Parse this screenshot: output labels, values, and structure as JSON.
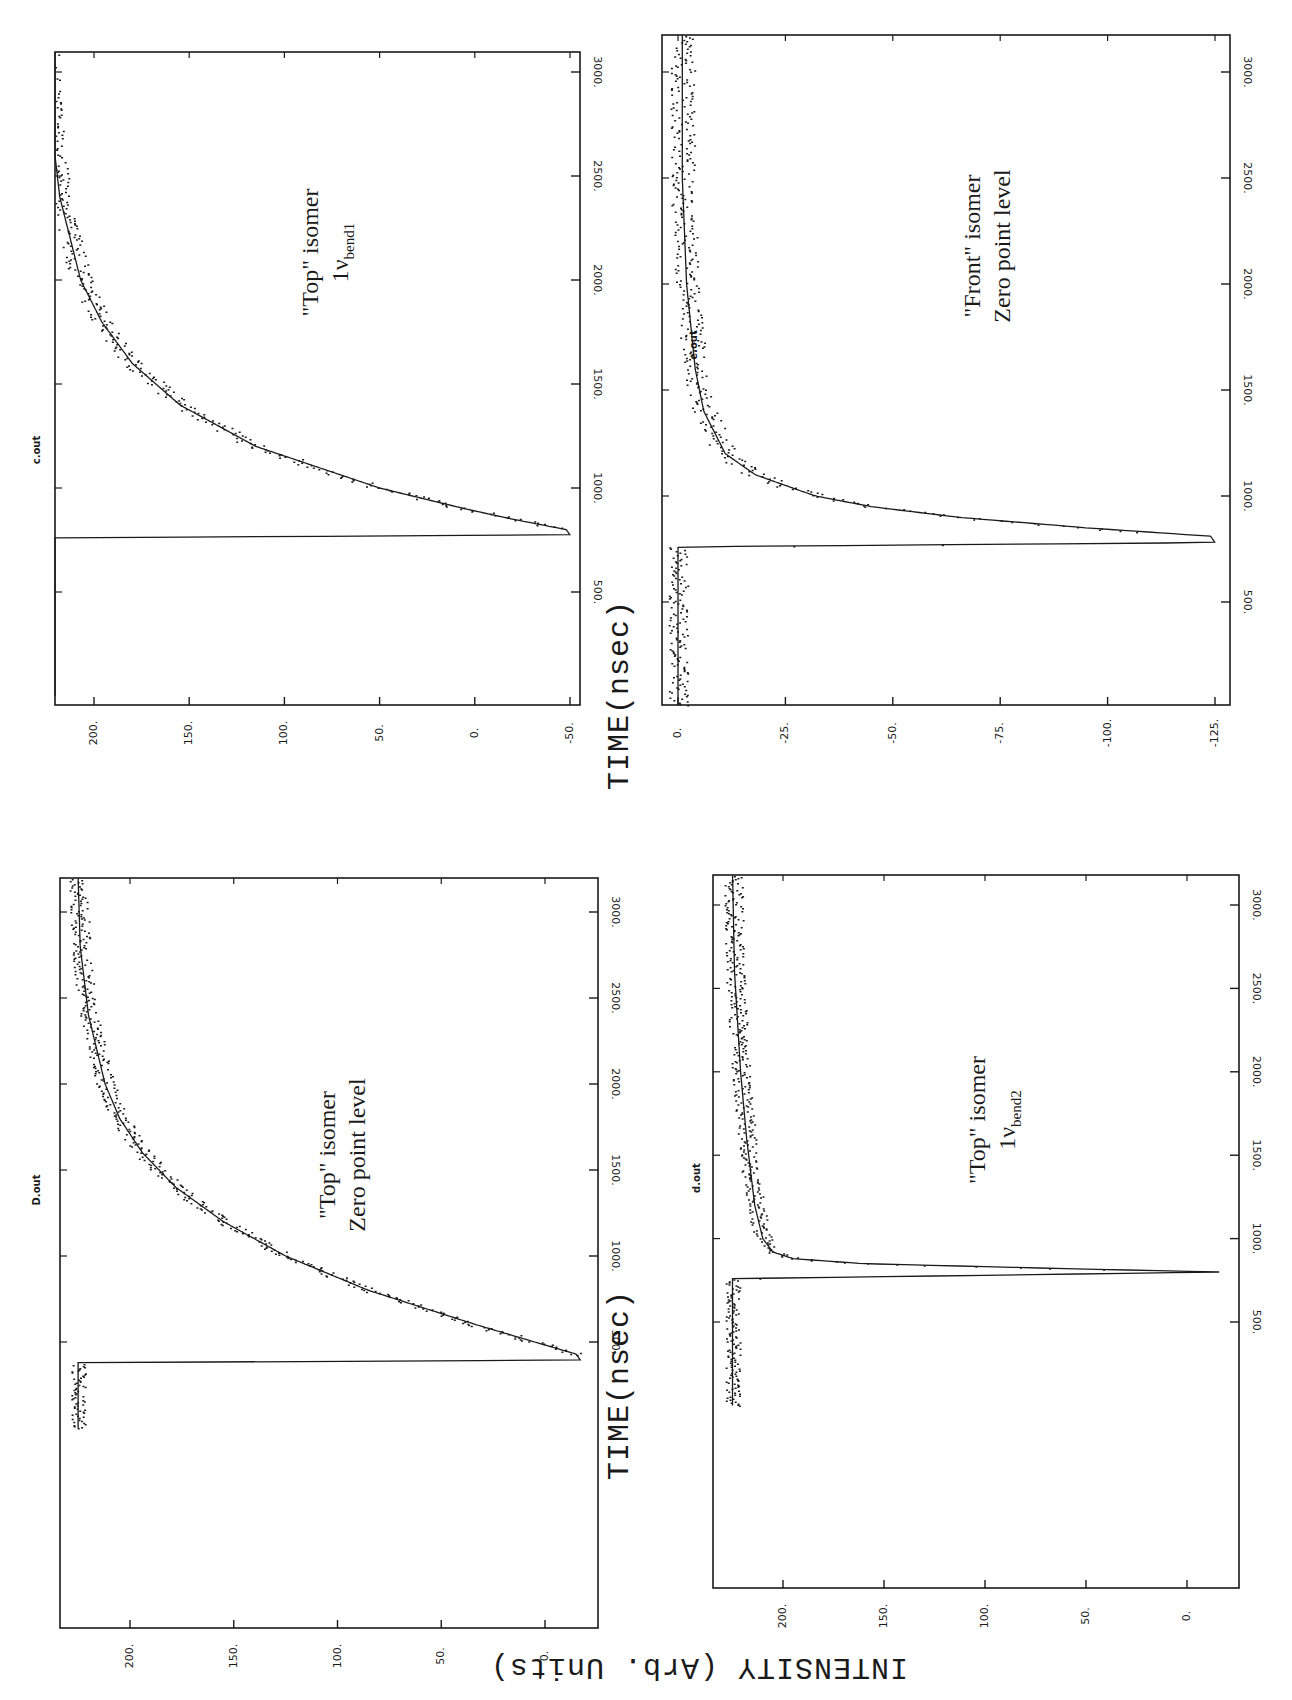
{
  "figure": {
    "orientation": "rotated 90 degrees counter-clockwise",
    "shared_xlabel": "TIME(nsec)",
    "shared_ylabel": "INTENSITY (Arb. Units)"
  },
  "chart_data": [
    {
      "type": "line",
      "panel": "top-left",
      "file_label": "c.out",
      "annotation": [
        "\"Top\" isomer",
        "1ν",
        "bend1"
      ],
      "annotation_text": "\"Top\" isomer 1ν_bend1",
      "xlabel": "TIME(nsec)",
      "ylabel": "INTENSITY (Arb. Units)",
      "x_ticks": [
        500,
        1000,
        1500,
        2000,
        2500,
        3000
      ],
      "x_tick_labels": [
        "500.",
        "1000.",
        "1500.",
        "2000.",
        "2500.",
        "3000."
      ],
      "y_ticks": [
        200,
        150,
        100,
        50,
        0,
        -50
      ],
      "y_tick_labels": [
        "200.",
        "150.",
        "100.",
        "50.",
        "0.",
        "-50."
      ],
      "xlim": [
        0,
        3200
      ],
      "ylim": [
        -55,
        235
      ],
      "grid": false,
      "series": [
        {
          "name": "data (noisy)",
          "style": "points",
          "x": [
            0,
            100,
            200,
            300,
            400,
            500,
            600,
            700,
            760,
            780,
            800,
            820,
            850,
            900,
            950,
            1000,
            1100,
            1200,
            1300,
            1400,
            1500,
            1600,
            1800,
            2000,
            2200,
            2400,
            2600,
            2800,
            3000,
            3150
          ],
          "y": [
            228,
            228,
            227,
            226,
            224,
            222,
            220,
            222,
            224,
            -48,
            -45,
            -30,
            -15,
            10,
            35,
            55,
            90,
            118,
            140,
            158,
            172,
            183,
            198,
            208,
            215,
            220,
            222,
            224,
            225,
            225
          ]
        },
        {
          "name": "fit",
          "style": "line",
          "x": [
            0,
            760,
            775,
            800,
            850,
            900,
            1000,
            1200,
            1400,
            1600,
            1800,
            2000,
            2400,
            2800,
            3200
          ],
          "y": [
            226,
            226,
            -50,
            -48,
            -20,
            5,
            50,
            115,
            155,
            180,
            196,
            207,
            218,
            223,
            225
          ]
        }
      ]
    },
    {
      "type": "line",
      "panel": "top-right",
      "file_label": "e.out",
      "annotation": [
        "\"Front\" isomer",
        "Zero point level"
      ],
      "annotation_text": "\"Front\" isomer Zero point level",
      "xlabel": "TIME(nsec)",
      "ylabel": "INTENSITY (Arb. Units)",
      "x_ticks": [
        500,
        1000,
        1500,
        2000,
        2500,
        3000
      ],
      "x_tick_labels": [
        "500.",
        "1000.",
        "1500.",
        "2000.",
        "2500.",
        "3000."
      ],
      "y_ticks": [
        0,
        -25,
        -50,
        -75,
        -100,
        -125
      ],
      "y_tick_labels": [
        "0.",
        "-25.",
        "-50.",
        "-75.",
        "-100.",
        "-125."
      ],
      "xlim": [
        0,
        3200
      ],
      "ylim": [
        -128,
        2
      ],
      "grid": false,
      "series": [
        {
          "name": "data (noisy)",
          "style": "points",
          "x": [
            0,
            200,
            400,
            600,
            760,
            800,
            820,
            850,
            900,
            950,
            1000,
            1100,
            1200,
            1300,
            1400,
            1500,
            1700,
            2000,
            2300,
            2600,
            3000,
            3150
          ],
          "y": [
            0,
            0,
            -1,
            -1,
            -1,
            -125,
            -120,
            -90,
            -60,
            -42,
            -30,
            -20,
            -12,
            -8,
            -6,
            -5,
            -4,
            -3,
            -2,
            -2,
            -1,
            -1
          ]
        },
        {
          "name": "fit",
          "style": "line",
          "x": [
            0,
            760,
            780,
            810,
            850,
            900,
            950,
            1000,
            1100,
            1200,
            1400,
            1600,
            2000,
            2500,
            3200
          ],
          "y": [
            0,
            0,
            -125,
            -124,
            -95,
            -65,
            -45,
            -32,
            -18,
            -11,
            -6,
            -4,
            -2,
            -1,
            -1
          ]
        }
      ]
    },
    {
      "type": "line",
      "panel": "bottom-left",
      "file_label": "D.out",
      "annotation": [
        "\"Top\" isomer",
        "Zero point level"
      ],
      "annotation_text": "\"Top\" isomer Zero point level",
      "xlabel": "TIME(nsec)",
      "ylabel": "INTENSITY (Arb. Units)",
      "x_ticks": [
        500,
        1000,
        1500,
        2000,
        2500,
        3000
      ],
      "x_tick_labels": [
        "500.",
        "1000.",
        "1500.",
        "2000.",
        "2500.",
        "3000."
      ],
      "y_ticks": [
        200,
        150,
        100,
        50,
        0
      ],
      "y_tick_labels": [
        "200.",
        "150.",
        "100.",
        "50.",
        "0."
      ],
      "xlim": [
        0,
        3200
      ],
      "ylim": [
        -20,
        235
      ],
      "grid": false,
      "series": [
        {
          "name": "data (noisy)",
          "style": "points",
          "x": [
            0,
            100,
            200,
            300,
            380,
            400,
            430,
            470,
            500,
            600,
            700,
            800,
            900,
            1000,
            1100,
            1200,
            1300,
            1400,
            1600,
            1800,
            2000,
            2200,
            2400,
            2600,
            2800,
            3000,
            3150
          ],
          "y": [
            226,
            224,
            222,
            220,
            222,
            -18,
            -14,
            -5,
            8,
            35,
            62,
            88,
            110,
            128,
            145,
            158,
            170,
            180,
            195,
            205,
            212,
            218,
            221,
            223,
            224,
            225,
            225
          ]
        },
        {
          "name": "fit",
          "style": "line",
          "x": [
            0,
            380,
            395,
            430,
            500,
            600,
            800,
            1000,
            1200,
            1400,
            1600,
            1800,
            2000,
            2400,
            2800,
            3200
          ],
          "y": [
            225,
            225,
            -17,
            -15,
            5,
            33,
            85,
            125,
            155,
            178,
            194,
            205,
            212,
            220,
            224,
            225
          ]
        }
      ]
    },
    {
      "type": "line",
      "panel": "bottom-right",
      "file_label": "d.out",
      "annotation": [
        "\"Top\" isomer",
        "1ν",
        "bend2"
      ],
      "annotation_text": "\"Top\" isomer 1ν_bend2",
      "xlabel": "TIME(nsec)",
      "ylabel": "INTENSITY (Arb. Units)",
      "x_ticks": [
        500,
        1000,
        1500,
        2000,
        2500,
        3000
      ],
      "x_tick_labels": [
        "500.",
        "1000.",
        "1500.",
        "2000.",
        "2500.",
        "3000."
      ],
      "y_ticks": [
        200,
        150,
        100,
        50,
        0
      ],
      "y_tick_labels": [
        "200.",
        "150.",
        "100.",
        "50.",
        "0."
      ],
      "xlim": [
        0,
        3200
      ],
      "ylim": [
        -20,
        232
      ],
      "grid": false,
      "series": [
        {
          "name": "data (noisy)",
          "style": "points",
          "x": [
            0,
            200,
            400,
            500,
            600,
            700,
            760,
            790,
            810,
            830,
            860,
            900,
            950,
            1000,
            1100,
            1200,
            1300,
            1500,
            1700,
            2000,
            2300,
            2600,
            3000,
            3150
          ],
          "y": [
            226,
            226,
            224,
            222,
            222,
            224,
            225,
            -16,
            -10,
            80,
            170,
            200,
            210,
            213,
            214,
            216,
            218,
            219,
            220,
            222,
            223,
            224,
            225,
            225
          ]
        },
        {
          "name": "fit",
          "style": "line",
          "x": [
            0,
            760,
            780,
            800,
            820,
            850,
            880,
            920,
            1000,
            1200,
            1600,
            2000,
            2600,
            3200
          ],
          "y": [
            225,
            225,
            100,
            -16,
            60,
            160,
            195,
            205,
            210,
            214,
            218,
            221,
            224,
            225
          ]
        }
      ]
    }
  ],
  "panels": [
    {
      "id": "top-left",
      "file_label": "c.out",
      "annotation_line1": "\"Top\" isomer",
      "annotation_line2_main": "1ν",
      "annotation_line2_sub": "bend1"
    },
    {
      "id": "top-right",
      "file_label": "e.out",
      "annotation_line1": "\"Front\" isomer",
      "annotation_line2_main": "Zero point level",
      "annotation_line2_sub": ""
    },
    {
      "id": "bottom-left",
      "file_label": "D.out",
      "annotation_line1": "\"Top\" isomer",
      "annotation_line2_main": "Zero point level",
      "annotation_line2_sub": ""
    },
    {
      "id": "bottom-right",
      "file_label": "d.out",
      "annotation_line1": "\"Top\" isomer",
      "annotation_line2_main": "1ν",
      "annotation_line2_sub": "bend2"
    }
  ],
  "labels": {
    "time_top": "TIME(nsec)",
    "time_bottom": "TIME(nsec)",
    "intensity": "INTENSITY (Arb. Units)"
  }
}
